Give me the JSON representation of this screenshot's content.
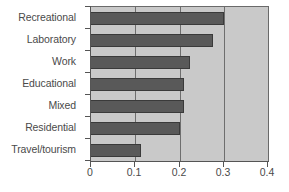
{
  "chart_data": {
    "type": "bar",
    "orientation": "horizontal",
    "title": "",
    "subtitle": "",
    "xlabel": "",
    "ylabel": "",
    "categories": [
      "Recreational",
      "Laboratory",
      "Work",
      "Educational",
      "Mixed",
      "Residential",
      "Travel/tourism"
    ],
    "values": [
      0.3,
      0.276,
      0.223,
      0.211,
      0.211,
      0.2,
      0.114
    ],
    "series": [
      {
        "name": "Proportion",
        "values": [
          0.3,
          0.276,
          0.223,
          0.211,
          0.211,
          0.2,
          0.114
        ]
      }
    ],
    "xlim": [
      0,
      0.4
    ],
    "xticks": [
      0,
      0.1,
      0.2,
      0.3,
      0.4
    ],
    "xtick_labels": [
      "0",
      "0.1",
      "0.2",
      "0.3",
      "0.4"
    ],
    "grid": true,
    "grid_axis": "x",
    "legend": false,
    "legend_position": "none",
    "bar_color": "#595959",
    "bar_edge_color": "#3a3a3a",
    "plot_background": "#c9c9c9",
    "figure_background": "#ffffff",
    "axis_color": "#555555",
    "gridline_color": "#6e6e6e",
    "text_color": "#4a4a4a",
    "annotations": []
  }
}
